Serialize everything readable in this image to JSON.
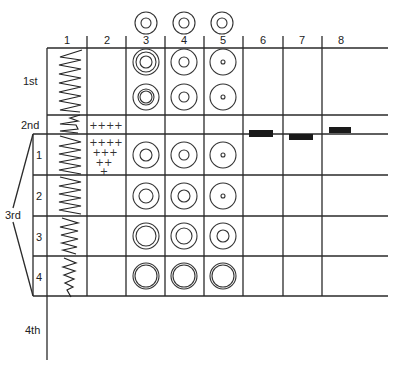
{
  "columns": [
    {
      "label": "1",
      "x": 67
    },
    {
      "label": "2",
      "x": 107
    },
    {
      "label": "3",
      "x": 146
    },
    {
      "label": "4",
      "x": 184
    },
    {
      "label": "5",
      "x": 223
    },
    {
      "label": "6",
      "x": 263
    },
    {
      "label": "7",
      "x": 302
    },
    {
      "label": "8",
      "x": 341
    }
  ],
  "rows": {
    "first": "1st",
    "second": "2nd",
    "third": "3rd",
    "fourth": "4th",
    "sub_rows": [
      "1",
      "2",
      "3",
      "4"
    ]
  },
  "top_circles": [
    {
      "col": "3",
      "rings": [
        11,
        5
      ]
    },
    {
      "col": "4",
      "rings": [
        11,
        5
      ]
    },
    {
      "col": "5",
      "rings": [
        11,
        5
      ]
    }
  ],
  "cells": {
    "first_row_a": {
      "col3": [
        13,
        10,
        6
      ],
      "col4": [
        13,
        5
      ],
      "col5": [
        13,
        2
      ]
    },
    "first_row_b": {
      "col3": [
        13,
        8,
        6
      ],
      "col4": [
        13,
        5
      ],
      "col5": [
        13,
        2
      ]
    },
    "sub1": {
      "col3": [
        13,
        6
      ],
      "col4": [
        13,
        5
      ],
      "col5": [
        13,
        2
      ]
    },
    "sub2": {
      "col3": [
        13,
        7
      ],
      "col4": [
        13,
        6
      ],
      "col5": [
        13,
        4
      ]
    },
    "sub3": {
      "col3": [
        13,
        10
      ],
      "col4": [
        13,
        8
      ],
      "col5": [
        13,
        7
      ]
    },
    "sub4": {
      "col3": [
        13,
        11
      ],
      "col4": [
        13,
        11
      ],
      "col5": [
        13,
        11
      ]
    }
  },
  "plus_marks": {
    "second_row": [
      "++++"
    ],
    "sub_row_1": [
      "++++",
      "+++",
      "++",
      "+"
    ]
  },
  "bars": [
    {
      "col": "6",
      "x": 249,
      "y": 130,
      "w": 24,
      "h": 7
    },
    {
      "col": "7",
      "x": 289,
      "y": 134,
      "w": 24,
      "h": 6
    },
    {
      "col": "8",
      "x": 329,
      "y": 127,
      "w": 22,
      "h": 6
    }
  ]
}
